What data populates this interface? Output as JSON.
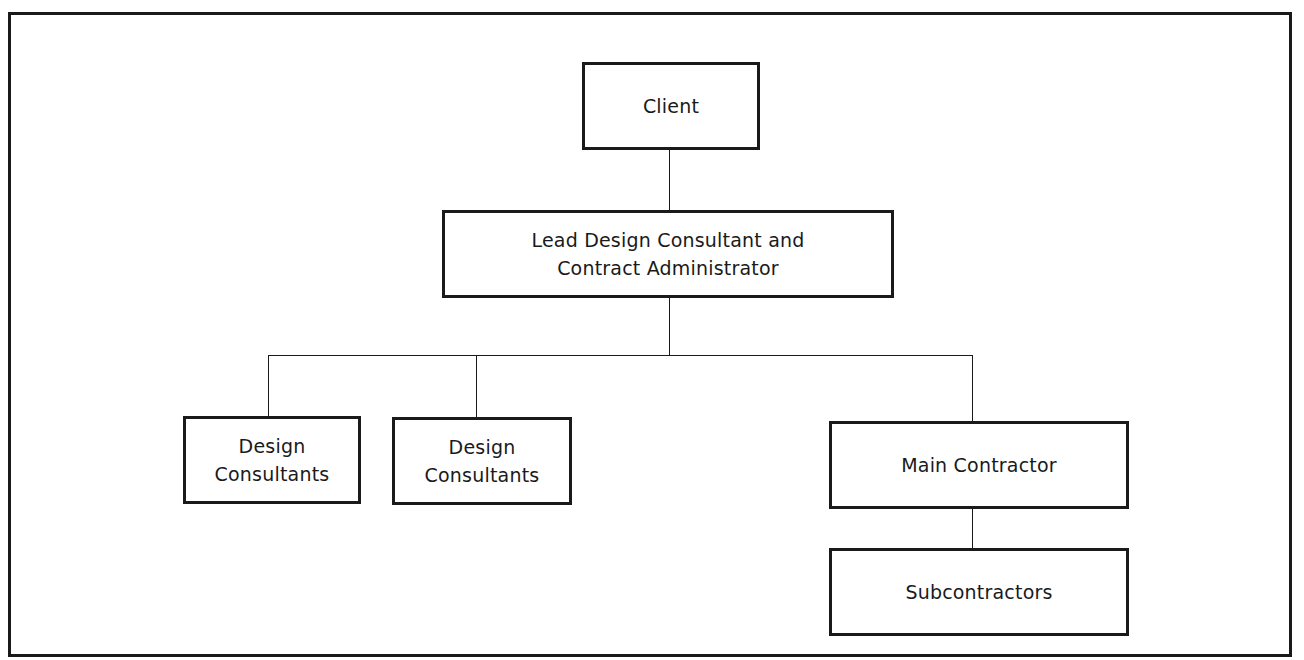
{
  "diagram": {
    "type": "organisational-chart",
    "nodes": {
      "client": {
        "lines": [
          "Client"
        ]
      },
      "lead": {
        "lines": [
          "Lead Design Consultant and",
          "Contract Administrator"
        ]
      },
      "design1": {
        "lines": [
          "Design",
          "Consultants"
        ]
      },
      "design2": {
        "lines": [
          "Design",
          "Consultants"
        ]
      },
      "main": {
        "lines": [
          "Main Contractor"
        ]
      },
      "sub": {
        "lines": [
          "Subcontractors"
        ]
      }
    },
    "edges": [
      {
        "from": "Client",
        "to": "Lead Design Consultant and Contract Administrator"
      },
      {
        "from": "Lead Design Consultant and Contract Administrator",
        "to": "Design Consultants (1)"
      },
      {
        "from": "Lead Design Consultant and Contract Administrator",
        "to": "Design Consultants (2)"
      },
      {
        "from": "Lead Design Consultant and Contract Administrator",
        "to": "Main Contractor"
      },
      {
        "from": "Main Contractor",
        "to": "Subcontractors"
      }
    ],
    "colors": {
      "stroke": "#1a1a1a",
      "background": "#ffffff"
    }
  }
}
